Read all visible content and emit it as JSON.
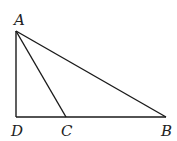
{
  "diagram": {
    "type": "geometry-triangle",
    "points": {
      "A": {
        "label": "A",
        "x": 16,
        "y": 31,
        "lx": 14,
        "ly": 25
      },
      "D": {
        "label": "D",
        "x": 16,
        "y": 117,
        "lx": 11,
        "ly": 136
      },
      "C": {
        "label": "C",
        "x": 66,
        "y": 117,
        "lx": 61,
        "ly": 136
      },
      "B": {
        "label": "B",
        "x": 166,
        "y": 117,
        "lx": 161,
        "ly": 136
      }
    },
    "segments": [
      [
        "A",
        "D"
      ],
      [
        "D",
        "B"
      ],
      [
        "A",
        "B"
      ],
      [
        "A",
        "C"
      ]
    ],
    "stroke_color": "#1a1a1a"
  }
}
